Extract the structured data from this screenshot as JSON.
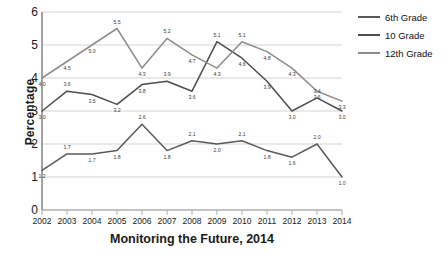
{
  "chart_data": {
    "type": "line",
    "title": "Monitoring the Future, 2014",
    "xlabel": "Monitoring the Future, 2014",
    "ylabel": "Percentage",
    "ylim": [
      0,
      6
    ],
    "yticks": [
      "0",
      "1",
      "2",
      "3",
      "4",
      "5",
      "6"
    ],
    "grid": true,
    "legend_position": "right",
    "categories": [
      "2002",
      "2003",
      "2004",
      "2005",
      "2006",
      "2007",
      "2008",
      "2009",
      "2010",
      "2011",
      "2012",
      "2013",
      "2014"
    ],
    "series": [
      {
        "name": "6th Grade",
        "color": "#595959",
        "values": [
          1.2,
          1.7,
          1.7,
          1.8,
          2.6,
          1.8,
          2.1,
          2.0,
          2.1,
          1.8,
          1.6,
          2.0,
          1.0
        ],
        "labels": [
          "1.2",
          "1.7",
          "1.7",
          "1.8",
          "2.6",
          "1.8",
          "2.1",
          "2.0",
          "2.1",
          "1.8",
          "1.6",
          "2.0",
          "1.0"
        ]
      },
      {
        "name": "10 Grade",
        "color": "#4d4d4d",
        "values": [
          3.0,
          3.6,
          3.5,
          3.2,
          3.8,
          3.9,
          3.6,
          5.1,
          4.6,
          3.9,
          3.0,
          3.4,
          3.0
        ],
        "labels": [
          "3.0",
          "3.6",
          "3.5",
          "3.2",
          "3.8",
          "3.9",
          "3.6",
          "5.1",
          "4.6",
          "3.9",
          "3.0",
          "3.4",
          "3.0"
        ]
      },
      {
        "name": "12th Grade",
        "color": "#8c8c8c",
        "values": [
          4.0,
          4.5,
          5.0,
          5.5,
          4.3,
          5.2,
          4.7,
          4.3,
          5.1,
          4.8,
          4.3,
          3.6,
          3.3
        ],
        "labels": [
          "4.0",
          "4.5",
          "5.0",
          "5.5",
          "4.3",
          "5.2",
          "4.7",
          "4.3",
          "5.1",
          "4.8",
          "4.3",
          "3.6",
          "3.3"
        ]
      }
    ]
  },
  "legend": {
    "items": [
      {
        "label": "6th Grade"
      },
      {
        "label": "10 Grade"
      },
      {
        "label": "12th Grade"
      }
    ]
  }
}
